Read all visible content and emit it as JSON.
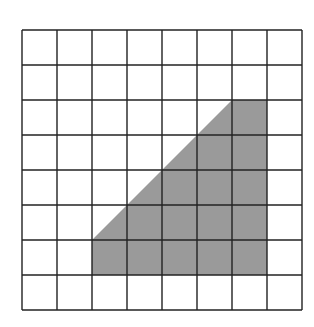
{
  "diagram": {
    "type": "grid-with-shaded-polygon",
    "grid": {
      "columns": 8,
      "rows": 8,
      "origin_x": 22,
      "origin_y": 30,
      "cell_size": 35,
      "line_color": "#222222",
      "background": "#ffffff"
    },
    "shaded_region": {
      "fill": "#9a9a9a",
      "vertices_grid": [
        [
          2,
          6
        ],
        [
          6,
          2
        ],
        [
          7,
          2
        ],
        [
          7,
          7
        ],
        [
          2,
          7
        ]
      ],
      "description": "Trapezoid-like polygon: diagonal edge from grid point (2,6) to (6,2), top edge to (7,2), right edge down to (7,7), bottom edge to (2,7), left edge up to (2,6)"
    }
  }
}
